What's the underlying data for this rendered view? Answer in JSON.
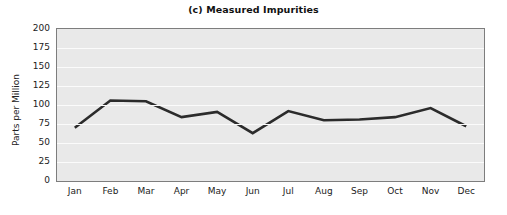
{
  "chart_data": {
    "type": "line",
    "title": "(c) Measured Impurities",
    "xlabel": "",
    "ylabel": "Parts per Million",
    "categories": [
      "Jan",
      "Feb",
      "Mar",
      "Apr",
      "May",
      "Jun",
      "Jul",
      "Aug",
      "Sep",
      "Oct",
      "Nov",
      "Dec"
    ],
    "values": [
      70,
      106,
      105,
      84,
      91,
      63,
      92,
      80,
      81,
      84,
      96,
      72
    ],
    "series": [
      {
        "name": "Measured Impurities",
        "values": [
          70,
          106,
          105,
          84,
          91,
          63,
          92,
          80,
          81,
          84,
          96,
          72
        ]
      }
    ],
    "ylim": [
      0,
      200
    ],
    "y_ticks": [
      0,
      25,
      50,
      75,
      100,
      125,
      150,
      175,
      200
    ],
    "y_tick_labels": [
      "0",
      "25",
      "50",
      "75",
      "100",
      "125",
      "150",
      "175",
      "200"
    ],
    "grid": "horizontal",
    "legend": "none",
    "markers": "none",
    "colors": {
      "line": "#2b2b2b",
      "plot_background": "#e9e9e9",
      "gridline": "#fbfbfb",
      "plot_border": "#7d7d7d",
      "figure_background": "#ffffff",
      "text": "#222222"
    }
  }
}
